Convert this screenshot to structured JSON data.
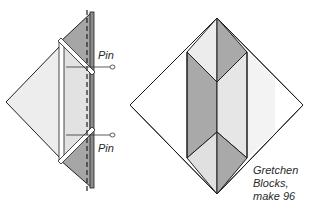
{
  "colors": {
    "background": "#ffffff",
    "outline": "#1e1e1e",
    "light_fill": "#ececec",
    "lighter_fill": "#f6f6f6",
    "mid_fill": "#dcdcdc",
    "dark_fill": "#a9a9a9",
    "strip_fill": "#ffffff"
  },
  "left_diagram": {
    "pin_labels": [
      "Pin",
      "Pin"
    ]
  },
  "right_diagram": {
    "caption_lines": [
      "Gretchen",
      "Blocks,",
      "make 96"
    ]
  }
}
